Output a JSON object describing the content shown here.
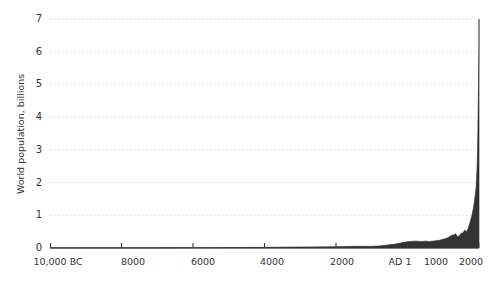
{
  "chart_data": {
    "type": "area",
    "title": "",
    "xlabel": "",
    "ylabel": "World population, billions",
    "xlim": [
      -10000,
      2000
    ],
    "ylim": [
      0,
      7
    ],
    "grid": true,
    "legend": false,
    "x_tick_labels": [
      "10,000 BC",
      "8000",
      "6000",
      "4000",
      "2000",
      "AD 1",
      "1000",
      "2000"
    ],
    "x_tick_values": [
      -10000,
      -8000,
      -6000,
      -4000,
      -2000,
      1,
      1000,
      2000
    ],
    "y_tick_labels": [
      "0",
      "1",
      "2",
      "3",
      "4",
      "5",
      "6",
      "7"
    ],
    "y_tick_values": [
      0,
      1,
      2,
      3,
      4,
      5,
      6,
      7
    ],
    "series": [
      {
        "name": "World population",
        "color": "#333333",
        "x": [
          -10000,
          -9000,
          -8000,
          -7000,
          -6000,
          -5000,
          -4000,
          -3000,
          -2000,
          -1500,
          -1000,
          -800,
          -500,
          -400,
          -200,
          1,
          200,
          400,
          500,
          600,
          700,
          800,
          900,
          1000,
          1100,
          1200,
          1250,
          1300,
          1340,
          1400,
          1450,
          1500,
          1550,
          1600,
          1650,
          1700,
          1750,
          1800,
          1850,
          1900,
          1920,
          1940,
          1950,
          1960,
          1970,
          1980,
          1990,
          2000
        ],
        "values": [
          0.004,
          0.005,
          0.005,
          0.007,
          0.01,
          0.015,
          0.02,
          0.03,
          0.04,
          0.05,
          0.05,
          0.06,
          0.1,
          0.11,
          0.15,
          0.19,
          0.21,
          0.2,
          0.21,
          0.2,
          0.21,
          0.22,
          0.24,
          0.27,
          0.3,
          0.36,
          0.4,
          0.4,
          0.44,
          0.35,
          0.37,
          0.45,
          0.46,
          0.55,
          0.5,
          0.6,
          0.79,
          0.98,
          1.26,
          1.65,
          1.86,
          2.3,
          2.52,
          3.02,
          3.7,
          4.44,
          5.32,
          6.14
        ]
      }
    ]
  }
}
